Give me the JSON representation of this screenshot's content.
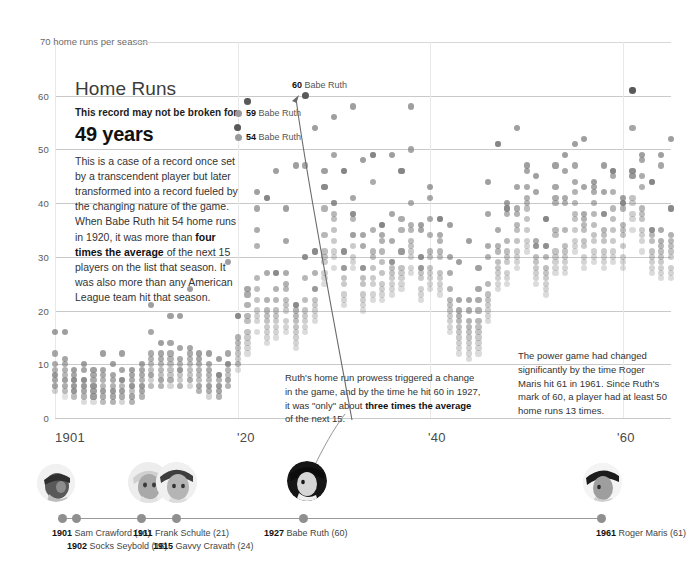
{
  "header": {
    "axis_note": "70 home runs per season"
  },
  "story": {
    "title": "Home Runs",
    "kicker": "This record may not be broken for",
    "big_number": "49 years",
    "para1": "This is a case of a record once set by a transcendent player but later transformed into a record fueled by the changing nature of the game.",
    "para2_a": "When Babe Ruth hit 54 home runs in 1920, it was more than ",
    "para2_b": "four times the average",
    "para2_c": " of the next 15 players on the list that season. It was also more than any American League team hit that season."
  },
  "callouts": [
    {
      "value": "60",
      "name": "Babe Ruth"
    },
    {
      "value": "59",
      "name": "Babe Ruth"
    },
    {
      "value": "54",
      "name": "Babe Ruth"
    }
  ],
  "annotations": {
    "ruth": {
      "a": "Ruth's home run prowess triggered a change in the game, and by the time he hit 60 in 1927, it was \"only\" about ",
      "b": "three times the average",
      "c": " of the next 15."
    },
    "maris": {
      "text": "The power game had changed significantly by the time Roger Maris hit 61 in 1961. Since Ruth's mark of 60, a player had at least 50 home runs 13 times."
    }
  },
  "timeline": {
    "entries": [
      {
        "year": "1901",
        "name": "Sam Crawford (16)"
      },
      {
        "year": "1902",
        "name": "Socks Seybold (16)"
      },
      {
        "year": "1911",
        "name": "Frank Schulte (21)"
      },
      {
        "year": "1915",
        "name": "Gavvy Cravath (24)"
      },
      {
        "year": "1927",
        "name": "Babe Ruth (60)"
      },
      {
        "year": "1961",
        "name": "Roger Maris (61)"
      }
    ]
  },
  "colors": {
    "dot": "#7a7a7a",
    "dot_dark": "#555555",
    "grid": "#c9c9c9",
    "text": "#333333"
  },
  "chart_data": {
    "type": "scatter",
    "title": "Home Runs",
    "xlabel": "",
    "ylabel": "home runs per season",
    "xlim": [
      1901,
      1965
    ],
    "ylim": [
      0,
      70
    ],
    "xticks": [
      1901,
      1920,
      1940,
      1960
    ],
    "xticklabels": [
      "1901",
      "'20",
      "'40",
      "'60"
    ],
    "yticks": [
      0,
      10,
      20,
      30,
      40,
      50,
      60,
      70
    ],
    "yticklabels": [
      "0",
      "10",
      "20",
      "30",
      "40",
      "50",
      "60",
      "70"
    ],
    "grid": true,
    "legend": null,
    "note": "Each column is one season; each dot is one of the top home-run hitters that season. Opacity varies.",
    "highlights": [
      {
        "year": 1927,
        "value": 60,
        "label": "60 Babe Ruth"
      },
      {
        "year": 1921,
        "value": 59,
        "label": "59 Babe Ruth"
      },
      {
        "year": 1920,
        "value": 54,
        "label": "54 Babe Ruth"
      },
      {
        "year": 1961,
        "value": 61,
        "label": "1961 Roger Maris (61)"
      }
    ],
    "series": [
      {
        "year": 1901,
        "values": [
          16,
          12,
          10,
          9,
          8,
          8,
          7,
          7,
          6,
          6,
          6,
          5,
          5
        ]
      },
      {
        "year": 1902,
        "values": [
          16,
          11,
          10,
          9,
          8,
          7,
          7,
          6,
          6,
          5,
          5,
          4
        ]
      },
      {
        "year": 1903,
        "values": [
          9,
          8,
          7,
          7,
          6,
          6,
          5,
          5,
          5,
          4,
          4
        ]
      },
      {
        "year": 1904,
        "values": [
          10,
          9,
          7,
          7,
          6,
          6,
          5,
          5,
          4,
          4,
          3
        ]
      },
      {
        "year": 1905,
        "values": [
          9,
          8,
          7,
          6,
          6,
          5,
          5,
          4,
          4,
          4,
          3
        ]
      },
      {
        "year": 1906,
        "values": [
          12,
          9,
          8,
          7,
          6,
          5,
          5,
          4,
          4,
          3,
          3
        ]
      },
      {
        "year": 1907,
        "values": [
          10,
          8,
          7,
          6,
          5,
          5,
          4,
          4,
          3,
          3
        ]
      },
      {
        "year": 1908,
        "values": [
          12,
          9,
          7,
          7,
          6,
          5,
          5,
          4,
          4,
          3
        ]
      },
      {
        "year": 1909,
        "values": [
          9,
          8,
          7,
          6,
          6,
          5,
          4,
          4,
          3,
          3
        ]
      },
      {
        "year": 1910,
        "values": [
          10,
          9,
          8,
          7,
          6,
          6,
          5,
          5,
          4,
          4
        ]
      },
      {
        "year": 1911,
        "values": [
          21,
          16,
          12,
          11,
          10,
          9,
          8,
          8,
          7,
          6,
          6
        ]
      },
      {
        "year": 1912,
        "values": [
          14,
          12,
          11,
          10,
          9,
          8,
          7,
          7,
          6,
          6
        ]
      },
      {
        "year": 1913,
        "values": [
          19,
          14,
          12,
          11,
          10,
          9,
          8,
          7,
          7,
          6
        ]
      },
      {
        "year": 1914,
        "values": [
          19,
          13,
          11,
          10,
          9,
          9,
          8,
          7,
          6,
          6
        ]
      },
      {
        "year": 1915,
        "values": [
          24,
          13,
          12,
          11,
          10,
          9,
          8,
          7,
          7,
          6
        ]
      },
      {
        "year": 1916,
        "values": [
          12,
          11,
          10,
          9,
          8,
          7,
          6,
          6,
          5,
          5
        ]
      },
      {
        "year": 1917,
        "values": [
          12,
          10,
          9,
          8,
          7,
          6,
          6,
          5,
          5,
          4
        ]
      },
      {
        "year": 1918,
        "values": [
          11,
          8,
          8,
          7,
          6,
          6,
          5,
          5,
          4,
          4
        ]
      },
      {
        "year": 1919,
        "values": [
          29,
          12,
          10,
          10,
          9,
          8,
          7,
          7,
          6,
          6
        ]
      },
      {
        "year": 1920,
        "values": [
          54,
          19,
          19,
          15,
          14,
          13,
          12,
          11,
          10,
          10,
          9
        ]
      },
      {
        "year": 1921,
        "values": [
          59,
          24,
          23,
          21,
          19,
          18,
          16,
          15,
          14,
          13,
          12
        ]
      },
      {
        "year": 1922,
        "values": [
          42,
          39,
          35,
          32,
          26,
          24,
          22,
          20,
          19,
          18,
          16
        ]
      },
      {
        "year": 1923,
        "values": [
          41,
          41,
          27,
          22,
          20,
          19,
          18,
          17,
          16,
          15,
          14
        ]
      },
      {
        "year": 1924,
        "values": [
          46,
          27,
          27,
          24,
          22,
          20,
          19,
          18,
          17,
          16,
          15
        ]
      },
      {
        "year": 1925,
        "values": [
          39,
          33,
          27,
          25,
          24,
          22,
          21,
          20,
          18,
          17,
          16
        ]
      },
      {
        "year": 1926,
        "values": [
          47,
          21,
          21,
          20,
          19,
          18,
          17,
          16,
          15,
          14,
          13
        ]
      },
      {
        "year": 1927,
        "values": [
          60,
          47,
          30,
          30,
          26,
          22,
          20,
          19,
          18,
          17,
          16
        ]
      },
      {
        "year": 1928,
        "values": [
          54,
          31,
          31,
          27,
          24,
          24,
          22,
          21,
          20,
          19,
          18
        ]
      },
      {
        "year": 1929,
        "values": [
          46,
          43,
          43,
          39,
          34,
          31,
          30,
          29,
          27,
          26,
          25
        ]
      },
      {
        "year": 1930,
        "values": [
          56,
          49,
          40,
          40,
          38,
          37,
          35,
          33,
          31,
          30,
          28
        ]
      },
      {
        "year": 1931,
        "values": [
          46,
          46,
          31,
          31,
          28,
          28,
          26,
          25,
          23,
          22,
          21
        ]
      },
      {
        "year": 1932,
        "values": [
          58,
          41,
          38,
          38,
          37,
          34,
          34,
          32,
          30,
          29,
          28
        ]
      },
      {
        "year": 1933,
        "values": [
          48,
          34,
          32,
          28,
          28,
          26,
          25,
          23,
          22,
          21,
          20
        ]
      },
      {
        "year": 1934,
        "values": [
          49,
          49,
          44,
          35,
          31,
          30,
          28,
          26,
          25,
          23,
          22
        ]
      },
      {
        "year": 1935,
        "values": [
          36,
          36,
          34,
          33,
          31,
          29,
          27,
          25,
          24,
          23,
          22
        ]
      },
      {
        "year": 1936,
        "values": [
          49,
          38,
          33,
          29,
          29,
          28,
          27,
          26,
          25,
          24,
          23
        ]
      },
      {
        "year": 1937,
        "values": [
          46,
          46,
          37,
          35,
          31,
          31,
          28,
          27,
          26,
          25,
          24
        ]
      },
      {
        "year": 1938,
        "values": [
          58,
          50,
          40,
          36,
          35,
          33,
          32,
          31,
          30,
          28,
          27
        ]
      },
      {
        "year": 1939,
        "values": [
          36,
          35,
          30,
          30,
          28,
          28,
          27,
          26,
          24,
          23,
          22
        ]
      },
      {
        "year": 1940,
        "values": [
          43,
          41,
          37,
          34,
          31,
          30,
          28,
          27,
          26,
          25,
          24
        ]
      },
      {
        "year": 1941,
        "values": [
          37,
          37,
          34,
          33,
          31,
          30,
          27,
          26,
          25,
          24,
          23
        ]
      },
      {
        "year": 1942,
        "values": [
          36,
          30,
          27,
          24,
          22,
          21,
          20,
          19,
          18,
          17,
          16
        ]
      },
      {
        "year": 1943,
        "values": [
          29,
          22,
          20,
          19,
          18,
          17,
          16,
          15,
          14,
          13,
          12
        ]
      },
      {
        "year": 1944,
        "values": [
          33,
          22,
          20,
          18,
          17,
          16,
          15,
          14,
          13,
          12,
          11
        ]
      },
      {
        "year": 1945,
        "values": [
          28,
          24,
          22,
          20,
          18,
          17,
          16,
          15,
          14,
          13,
          12
        ]
      },
      {
        "year": 1946,
        "values": [
          44,
          38,
          32,
          30,
          25,
          23,
          22,
          21,
          20,
          19,
          18
        ]
      },
      {
        "year": 1947,
        "values": [
          51,
          51,
          35,
          32,
          31,
          29,
          28,
          27,
          26,
          25,
          24
        ]
      },
      {
        "year": 1948,
        "values": [
          40,
          39,
          39,
          38,
          33,
          31,
          30,
          29,
          27,
          26,
          25
        ]
      },
      {
        "year": 1949,
        "values": [
          54,
          43,
          39,
          38,
          36,
          35,
          33,
          31,
          30,
          29,
          28
        ]
      },
      {
        "year": 1950,
        "values": [
          47,
          46,
          43,
          41,
          40,
          39,
          37,
          35,
          33,
          32,
          31
        ]
      },
      {
        "year": 1951,
        "values": [
          45,
          42,
          33,
          32,
          32,
          30,
          29,
          28,
          27,
          26,
          25
        ]
      },
      {
        "year": 1952,
        "values": [
          37,
          37,
          32,
          32,
          30,
          28,
          27,
          26,
          25,
          24,
          23
        ]
      },
      {
        "year": 1953,
        "values": [
          47,
          43,
          41,
          40,
          35,
          34,
          31,
          30,
          29,
          28,
          27
        ]
      },
      {
        "year": 1954,
        "values": [
          49,
          46,
          41,
          40,
          35,
          32,
          31,
          30,
          29,
          28,
          27
        ]
      },
      {
        "year": 1955,
        "values": [
          51,
          47,
          44,
          42,
          40,
          38,
          37,
          35,
          33,
          32,
          31
        ]
      },
      {
        "year": 1956,
        "values": [
          52,
          43,
          38,
          37,
          36,
          35,
          33,
          32,
          30,
          29,
          28
        ]
      },
      {
        "year": 1957,
        "values": [
          44,
          43,
          42,
          40,
          38,
          36,
          34,
          33,
          31,
          30,
          29
        ]
      },
      {
        "year": 1958,
        "values": [
          47,
          42,
          38,
          38,
          35,
          34,
          33,
          31,
          30,
          29,
          28
        ]
      },
      {
        "year": 1959,
        "values": [
          46,
          46,
          45,
          42,
          39,
          37,
          35,
          33,
          31,
          30,
          29
        ]
      },
      {
        "year": 1960,
        "values": [
          41,
          40,
          40,
          39,
          36,
          35,
          34,
          32,
          30,
          29,
          28
        ]
      },
      {
        "year": 1961,
        "values": [
          61,
          54,
          46,
          46,
          45,
          45,
          41,
          40,
          38,
          37,
          35
        ]
      },
      {
        "year": 1962,
        "values": [
          49,
          48,
          45,
          43,
          39,
          38,
          37,
          35,
          34,
          33,
          31
        ]
      },
      {
        "year": 1963,
        "values": [
          44,
          44,
          35,
          35,
          34,
          33,
          31,
          30,
          29,
          28,
          27
        ]
      },
      {
        "year": 1964,
        "values": [
          49,
          47,
          35,
          33,
          32,
          31,
          30,
          29,
          28,
          27,
          26
        ]
      },
      {
        "year": 1965,
        "values": [
          52,
          39,
          39,
          34,
          33,
          32,
          31,
          30,
          28,
          27,
          26
        ]
      }
    ]
  }
}
